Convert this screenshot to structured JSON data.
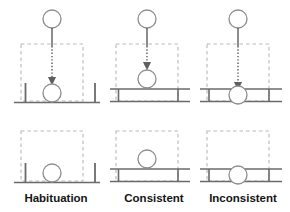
{
  "figure": {
    "title": "",
    "width": 290,
    "height": 212,
    "background": "#ffffff",
    "stroke_dark": "#5a5a5a",
    "stroke_ball": "#8a8a8a",
    "stroke_dashed": "#b9b9b9",
    "stroke_arrow": "#6e6e6e",
    "label_color": "#141414"
  },
  "columns": [
    {
      "id": "habituation",
      "label": "Habituation",
      "center_x": 56
    },
    {
      "id": "consistent",
      "label": "Consistent",
      "center_x": 153
    },
    {
      "id": "inconsistent",
      "label": "Inconsistent",
      "center_x": 242
    }
  ],
  "rows": [
    {
      "id": "event-sequence",
      "has_falling_ball": true,
      "has_trajectory_arrow": true
    },
    {
      "id": "outcome",
      "has_falling_ball": false,
      "has_trajectory_arrow": false
    }
  ],
  "panels": [
    {
      "id": "habituation-event",
      "column": "habituation",
      "row": "event-sequence",
      "start_ball": {
        "cx": 52,
        "cy": 19,
        "r": 9
      },
      "trajectory": {
        "x": 52,
        "y_solid_start": 28,
        "y_dash_start": 44,
        "y_end": 83
      },
      "occluder_box": {
        "x": 21,
        "y": 44,
        "width": 62,
        "height": 57
      },
      "support": {
        "type": "posts",
        "ground_y": 102,
        "ground_x1": 14,
        "ground_x2": 100,
        "post_left_x": 25,
        "post_right_x": 95,
        "post_top_y": 83
      },
      "rest_ball": {
        "cx": 52,
        "cy": 93,
        "r": 9
      }
    },
    {
      "id": "consistent-event",
      "column": "consistent",
      "row": "event-sequence",
      "start_ball": {
        "cx": 147,
        "cy": 19,
        "r": 9
      },
      "trajectory": {
        "x": 147,
        "y_solid_start": 28,
        "y_dash_start": 44,
        "y_end": 67
      },
      "occluder_box": {
        "x": 116,
        "y": 44,
        "width": 62,
        "height": 57
      },
      "support": {
        "type": "beam",
        "beam_top_y": 89,
        "beam_bottom_y": 101,
        "beam_x1": 110,
        "beam_x2": 190
      },
      "rest_ball": {
        "cx": 147,
        "cy": 79,
        "r": 9
      }
    },
    {
      "id": "inconsistent-event",
      "column": "inconsistent",
      "row": "event-sequence",
      "start_ball": {
        "cx": 238,
        "cy": 19,
        "r": 9
      },
      "trajectory": {
        "x": 238,
        "y_solid_start": 28,
        "y_dash_start": 44,
        "y_end": 88
      },
      "occluder_box": {
        "x": 207,
        "y": 44,
        "width": 62,
        "height": 57
      },
      "support": {
        "type": "beam",
        "beam_top_y": 89,
        "beam_bottom_y": 101,
        "beam_x1": 200,
        "beam_x2": 282
      },
      "rest_ball": {
        "cx": 238,
        "cy": 95,
        "r": 9
      }
    },
    {
      "id": "habituation-outcome",
      "column": "habituation",
      "row": "outcome",
      "occluder_box": {
        "x": 21,
        "y": 131,
        "width": 62,
        "height": 50
      },
      "support": {
        "type": "posts",
        "ground_y": 182,
        "ground_x1": 14,
        "ground_x2": 100,
        "post_left_x": 25,
        "post_right_x": 95,
        "post_top_y": 163
      },
      "rest_ball": {
        "cx": 52,
        "cy": 173,
        "r": 9
      }
    },
    {
      "id": "consistent-outcome",
      "column": "consistent",
      "row": "outcome",
      "occluder_box": {
        "x": 116,
        "y": 131,
        "width": 62,
        "height": 50
      },
      "support": {
        "type": "beam",
        "beam_top_y": 169,
        "beam_bottom_y": 181,
        "beam_x1": 110,
        "beam_x2": 190
      },
      "rest_ball": {
        "cx": 147,
        "cy": 159,
        "r": 9
      }
    },
    {
      "id": "inconsistent-outcome",
      "column": "inconsistent",
      "row": "outcome",
      "occluder_box": {
        "x": 207,
        "y": 131,
        "width": 62,
        "height": 50
      },
      "support": {
        "type": "beam",
        "beam_top_y": 169,
        "beam_bottom_y": 181,
        "beam_x1": 200,
        "beam_x2": 282
      },
      "rest_ball": {
        "cx": 238,
        "cy": 175,
        "r": 9
      }
    }
  ],
  "labels": {
    "habituation": "Habituation",
    "consistent": "Consistent",
    "inconsistent": "Inconsistent"
  }
}
